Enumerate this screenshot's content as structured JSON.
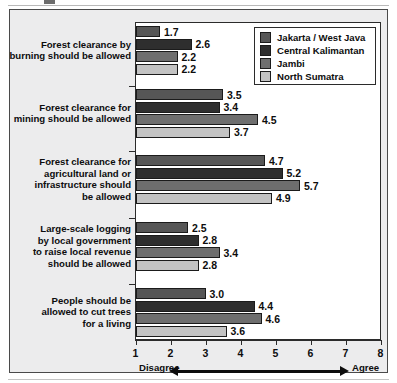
{
  "chart_data": {
    "type": "bar",
    "orientation": "horizontal",
    "title": "",
    "xlabel": "",
    "ylabel": "",
    "xlim": [
      1,
      8
    ],
    "xticks": [
      1,
      2,
      3,
      4,
      5,
      6,
      7,
      8
    ],
    "grid": false,
    "legend_position": "top-right",
    "axis_anchor_low": "Disagree",
    "axis_anchor_high": "Agree",
    "categories": [
      "Forest clearance by burning should be allowed",
      "Forest clearance for mining should be allowed",
      "Forest clearance for agricultural land or infrastructure should be allowed",
      "Large-scale logging by local government to raise local revenue should be allowed",
      "People should be allowed to cut trees for a living"
    ],
    "category_lines": [
      [
        "Forest clearance by",
        "burning should be allowed"
      ],
      [
        "Forest clearance for",
        "mining should be allowed"
      ],
      [
        "Forest clearance for",
        "agricultural land or",
        "infrastructure should",
        "be allowed"
      ],
      [
        "Large-scale logging",
        "by local government",
        "to raise local revenue",
        "should be allowed"
      ],
      [
        "People should be",
        "allowed to cut trees",
        "for a living"
      ]
    ],
    "series": [
      {
        "name": "Jakarta / West Java",
        "color": "#565656",
        "values": [
          1.7,
          3.5,
          4.7,
          2.5,
          3.0
        ]
      },
      {
        "name": "Central Kalimantan",
        "color": "#2e2e2e",
        "values": [
          2.6,
          3.4,
          5.2,
          2.8,
          4.4
        ]
      },
      {
        "name": "Jambi",
        "color": "#6e6e6e",
        "values": [
          2.2,
          4.5,
          5.7,
          3.4,
          4.6
        ]
      },
      {
        "name": "North Sumatra",
        "color": "#c3c3c3",
        "values": [
          2.2,
          3.7,
          4.9,
          2.8,
          3.6
        ]
      }
    ],
    "value_labels": [
      [
        "1.7",
        "2.6",
        "2.2",
        "2.2"
      ],
      [
        "3.5",
        "3.4",
        "4.5",
        "3.7"
      ],
      [
        "4.7",
        "5.2",
        "5.7",
        "4.9"
      ],
      [
        "2.5",
        "2.8",
        "3.4",
        "2.8"
      ],
      [
        "3.0",
        "4.4",
        "4.6",
        "3.6"
      ]
    ],
    "tick_labels": [
      "1",
      "2",
      "3",
      "4",
      "5",
      "6",
      "7",
      "8"
    ]
  }
}
